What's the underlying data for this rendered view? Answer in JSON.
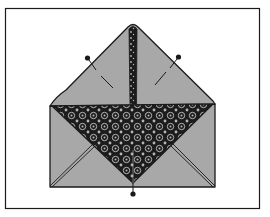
{
  "figure": {
    "colors": {
      "background": "#ffffff",
      "frame": "#1a1a1a",
      "fabric": "#a8a8a8",
      "outline": "#1a1a1a",
      "pattern_dark": "#1c1c1c",
      "pattern_light": "#b5b5b5"
    },
    "elements": {
      "frame": "border-frame",
      "top_flap": "top-triangular-flap",
      "center_strip": "patterned-center-strip",
      "body": "envelope-body",
      "patterned_triangle": "patterned-fabric-triangle",
      "pins": [
        "left-pin",
        "right-pin",
        "bottom-pin"
      ]
    }
  }
}
